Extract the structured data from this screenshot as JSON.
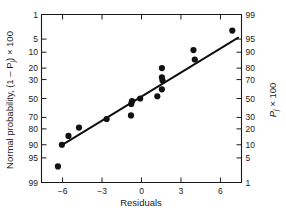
{
  "chart_data": {
    "type": "scatter",
    "title": "",
    "xlabel": "Residuals",
    "ylabel_left": "Normal probability, (1 – P",
    "ylabel_left_sub": "j",
    "ylabel_left_tail": ") × 100",
    "ylabel_right": "P",
    "ylabel_right_sub": "j",
    "ylabel_right_tail": " × 100",
    "xlim": [
      -7.6,
      7.6
    ],
    "xticks": [
      -6,
      -3,
      0,
      3,
      6
    ],
    "xticklabels": [
      "−6",
      "−3",
      "0",
      "3",
      "6"
    ],
    "left_axis_name": "Normal probability, (1 − Pj) × 100",
    "right_axis_name": "Pj × 100",
    "yticks_left": [
      1,
      5,
      10,
      20,
      30,
      50,
      70,
      80,
      90,
      95,
      99
    ],
    "yticklabels_left": [
      "1",
      "5",
      "10",
      "20",
      "30",
      "50",
      "70",
      "80",
      "90",
      "95",
      "99"
    ],
    "yticks_right": [
      99,
      95,
      90,
      80,
      70,
      50,
      30,
      20,
      10,
      5,
      1
    ],
    "yticklabels_right": [
      "99",
      "95",
      "90",
      "80",
      "70",
      "50",
      "30",
      "20",
      "10",
      "5",
      "1"
    ],
    "y_scale": "normal-probability",
    "grid": false,
    "legend": false,
    "marker": "filled-circle",
    "marker_color": "#111111",
    "line_color": "#0d0d0d",
    "points": [
      {
        "x": -6.35,
        "y_left": 97.0
      },
      {
        "x": -6.05,
        "y_left": 90.0
      },
      {
        "x": -5.55,
        "y_left": 85.0
      },
      {
        "x": -4.75,
        "y_left": 79.0
      },
      {
        "x": -2.65,
        "y_left": 71.5
      },
      {
        "x": -0.8,
        "y_left": 68.0
      },
      {
        "x": -0.78,
        "y_left": 56.0
      },
      {
        "x": -0.72,
        "y_left": 53.0
      },
      {
        "x": -0.1,
        "y_left": 50.0
      },
      {
        "x": 1.2,
        "y_left": 47.5
      },
      {
        "x": 1.55,
        "y_left": 20.0
      },
      {
        "x": 1.55,
        "y_left": 28.0
      },
      {
        "x": 1.6,
        "y_left": 31.0
      },
      {
        "x": 1.55,
        "y_left": 40.0
      },
      {
        "x": 4.05,
        "y_left": 14.0
      },
      {
        "x": 3.95,
        "y_left": 9.0
      },
      {
        "x": 6.9,
        "y_left": 3.0
      }
    ],
    "fit_line": {
      "x0": -6.15,
      "y0_left": 90.5,
      "x1": 7.35,
      "y1_left": 4.6
    },
    "annotations": []
  },
  "figure": {
    "caption": ""
  }
}
